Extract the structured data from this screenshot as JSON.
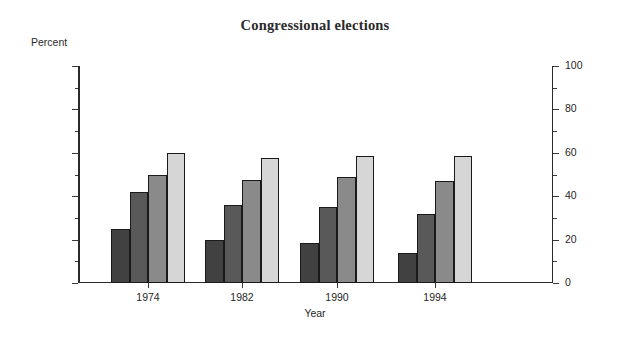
{
  "chart_data": {
    "type": "bar",
    "title": "Congressional elections",
    "xlabel": "Year",
    "ylabel": "Percent",
    "y_unit_label": "Percent",
    "categories": [
      "1974",
      "1982",
      "1990",
      "1994"
    ],
    "ylim": [
      0,
      100
    ],
    "yticks": [
      0,
      20,
      40,
      60,
      80,
      100
    ],
    "ytick_labels": [
      "0",
      "20",
      "40",
      "60",
      "80",
      "100"
    ],
    "minor_ytick_step": 10,
    "grid": false,
    "legend": "none",
    "dual_axis": true,
    "right_axis_ticks": [
      0,
      20,
      40,
      60,
      80,
      100
    ],
    "right_axis_tick_labels": [
      "0",
      "20",
      "40",
      "60",
      "80",
      "100"
    ],
    "series": [
      {
        "name": "series-1",
        "color": "#414141",
        "values": [
          25.0,
          20.0,
          18.5,
          14.0
        ]
      },
      {
        "name": "series-2",
        "color": "#595959",
        "values": [
          42.0,
          36.0,
          35.0,
          32.0
        ]
      },
      {
        "name": "series-3",
        "color": "#8a8a8a",
        "values": [
          50.0,
          47.5,
          49.0,
          47.0
        ]
      },
      {
        "name": "series-4",
        "color": "#d6d6d6",
        "values": [
          60.0,
          57.5,
          58.5,
          58.5
        ]
      }
    ]
  },
  "colors": {
    "background": "#ffffff",
    "axis": "#2b2b2b",
    "text": "#1f1f1f",
    "title": "#2a2a2a"
  }
}
